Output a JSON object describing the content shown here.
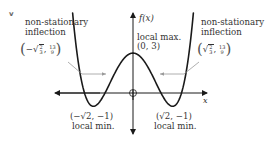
{
  "figure": {
    "corner_mark": "v",
    "y_axis_label": "f(x)",
    "x_axis_label": "x",
    "function": "f(x) = x^4 - 4x^2 + 3",
    "annotations": {
      "local_max": {
        "label": "local max.",
        "coords": "(0, 3)"
      },
      "local_min_left": {
        "label": "local min.",
        "coords": "(−√2, −1)"
      },
      "local_min_right": {
        "label": "local min.",
        "coords": "(√2, −1)"
      },
      "inflection_left": {
        "label_line1": "non-stationary",
        "label_line2": "inflection",
        "x_sign": "−",
        "sqrt_num": "2",
        "sqrt_den": "3",
        "y_num": "13",
        "y_den": "9"
      },
      "inflection_right": {
        "label_line1": "non-stationary",
        "label_line2": "inflection",
        "x_sign": "",
        "sqrt_num": "2",
        "sqrt_den": "3",
        "y_num": "13",
        "y_den": "9"
      }
    },
    "colors": {
      "curve": "#1a1a1a",
      "axes": "#1a1a1a",
      "leader_lines": "#9a9a9a",
      "text": "#333333"
    }
  }
}
